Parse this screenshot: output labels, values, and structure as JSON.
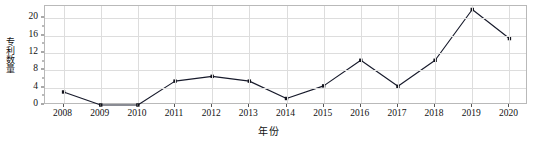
{
  "chart_data": {
    "type": "line",
    "title": "",
    "subtitle": "",
    "xlabel": "年份",
    "ylabel": "专利数量",
    "categories": [
      "2008",
      "2009",
      "2010",
      "2011",
      "2012",
      "2013",
      "2014",
      "2015",
      "2016",
      "2017",
      "2018",
      "2019",
      "2020"
    ],
    "x": [
      2008,
      2009,
      2010,
      2011,
      2012,
      2013,
      2014,
      2015,
      2016,
      2017,
      2018,
      2019,
      2020
    ],
    "values": [
      3.0,
      0.0,
      0.0,
      5.5,
      6.6,
      5.5,
      1.5,
      4.4,
      10.3,
      4.3,
      10.3,
      22.0,
      15.3
    ],
    "series": [
      {
        "name": "专利数量",
        "values": [
          3.0,
          0.0,
          0.0,
          5.5,
          6.6,
          5.5,
          1.5,
          4.4,
          10.3,
          4.3,
          10.3,
          22.0,
          15.3
        ],
        "color": "#171a2b",
        "marker": "square"
      }
    ],
    "ylim": [
      0,
      22.8
    ],
    "xlim": [
      2007.5,
      2020.5
    ],
    "yticks": [
      0,
      4,
      8,
      12,
      16,
      20
    ],
    "ytick_labels": [
      "0",
      "4",
      "8",
      "12",
      "16",
      "20"
    ],
    "xtick_labels": [
      "2008",
      "2009",
      "2010",
      "2011",
      "2012",
      "2013",
      "2014",
      "2015",
      "2016",
      "2017",
      "2018",
      "2019",
      "2020"
    ],
    "grid": true,
    "grid_color": "#dddddd",
    "legend": false,
    "legend_position": "none",
    "frame_color": "#b9b9b9",
    "background": "#ffffff",
    "annotations": []
  }
}
